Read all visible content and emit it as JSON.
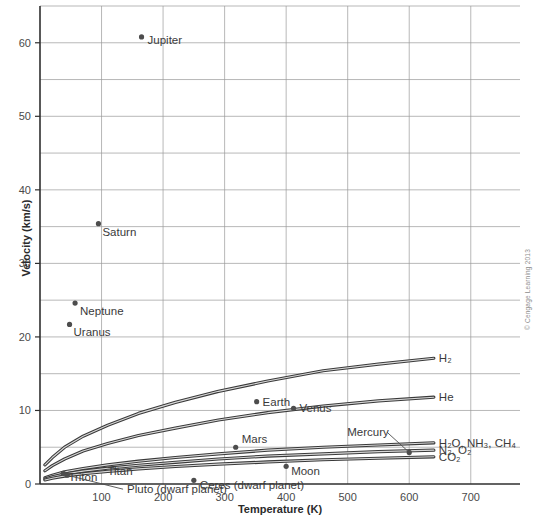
{
  "figure": {
    "credit": "© Cengage Learning 2013"
  },
  "chart_data": {
    "type": "scatter",
    "title": "",
    "xlabel": "Temperature (K)",
    "ylabel": "Velocity (km/s)",
    "xlim": [
      0,
      780
    ],
    "ylim": [
      0,
      65
    ],
    "grid": true,
    "x_ticks": [
      100,
      200,
      300,
      400,
      500,
      600,
      700
    ],
    "x_tick_labels": [
      "100",
      "200",
      "300",
      "400",
      "500",
      "600",
      "700"
    ],
    "x_gridlines": [
      100,
      200,
      300,
      400,
      500,
      600,
      700
    ],
    "y_ticks": [
      0,
      10,
      20,
      30,
      40,
      50,
      60
    ],
    "y_tick_labels": [
      "0",
      "10",
      "20",
      "30",
      "40",
      "50",
      "60"
    ],
    "y_gridlines": [
      5,
      10,
      15,
      20,
      25,
      30,
      35,
      40,
      45,
      50,
      55,
      60,
      65
    ],
    "legend_position": "inline-end-labels",
    "points": [
      {
        "name": "Jupiter",
        "x": 165,
        "y": 60.8,
        "label": "Jupiter",
        "label_dx": 6,
        "label_dy": 7
      },
      {
        "name": "Saturn",
        "x": 95,
        "y": 35.4,
        "label": "Saturn",
        "label_dx": 4,
        "label_dy": 12
      },
      {
        "name": "Neptune",
        "x": 57,
        "y": 24.6,
        "label": "Neptune",
        "label_dx": 5,
        "label_dy": 12
      },
      {
        "name": "Uranus",
        "x": 48,
        "y": 21.7,
        "label": "Uranus",
        "label_dx": 4,
        "label_dy": 12
      },
      {
        "name": "Earth",
        "x": 352,
        "y": 11.2,
        "label": "Earth",
        "label_dx": 6,
        "label_dy": 4
      },
      {
        "name": "Venus",
        "x": 412,
        "y": 10.3,
        "label": "Venus",
        "label_dx": 6,
        "label_dy": 4
      },
      {
        "name": "Mars",
        "x": 318,
        "y": 5.0,
        "label": "Mars",
        "label_dx": 6,
        "label_dy": -4
      },
      {
        "name": "Mercury",
        "x": 600,
        "y": 4.3,
        "label": "Mercury",
        "label_dx": -62,
        "label_dy": -16,
        "leader": true
      },
      {
        "name": "Moon",
        "x": 400,
        "y": 2.4,
        "label": "Moon",
        "label_dx": 5,
        "label_dy": 9
      },
      {
        "name": "Titan",
        "x": 95,
        "y": 2.6,
        "label": "Titan",
        "label_dx": 9,
        "label_dy": 10,
        "hide_dot": true
      },
      {
        "name": "Triton",
        "x": 38,
        "y": 1.45,
        "label": "Triton",
        "label_dx": 5,
        "label_dy": 8
      },
      {
        "name": "Pluto (dwarf planet)",
        "x": 44,
        "y": 1.2,
        "label": "Pluto (dwarf planet)",
        "label_dx": 60,
        "label_dy": 18,
        "leader": true
      },
      {
        "name": "Ceres (dwarf planet)",
        "x": 250,
        "y": 0.5,
        "label": "Ceres (dwarf planet)",
        "label_dx": 6,
        "label_dy": 9
      }
    ],
    "series": [
      {
        "name": "H2",
        "label": "H₂",
        "x": [
          8,
          20,
          40,
          70,
          110,
          160,
          220,
          290,
          370,
          460,
          550,
          640
        ],
        "values": [
          2.6,
          3.6,
          5.0,
          6.5,
          8.0,
          9.6,
          11.1,
          12.6,
          14.0,
          15.4,
          16.3,
          17.1
        ]
      },
      {
        "name": "He",
        "label": "He",
        "x": [
          8,
          20,
          40,
          70,
          110,
          160,
          220,
          290,
          370,
          460,
          550,
          640
        ],
        "values": [
          1.8,
          2.5,
          3.4,
          4.5,
          5.5,
          6.6,
          7.6,
          8.7,
          9.7,
          10.6,
          11.3,
          11.8
        ]
      },
      {
        "name": "H2O, NH3, CH4",
        "label": "H₂O, NH₃, CH₄",
        "x": [
          8,
          20,
          40,
          70,
          110,
          160,
          220,
          290,
          370,
          460,
          550,
          640
        ],
        "values": [
          0.85,
          1.2,
          1.65,
          2.1,
          2.6,
          3.1,
          3.6,
          4.1,
          4.6,
          5.0,
          5.3,
          5.6
        ]
      },
      {
        "name": "N2, O2",
        "label": "N₂, O₂",
        "x": [
          8,
          20,
          40,
          70,
          110,
          160,
          220,
          290,
          370,
          460,
          550,
          640
        ],
        "values": [
          0.68,
          0.98,
          1.35,
          1.75,
          2.15,
          2.55,
          2.95,
          3.4,
          3.8,
          4.1,
          4.4,
          4.6
        ]
      },
      {
        "name": "CO2",
        "label": "CO₂",
        "x": [
          8,
          20,
          40,
          70,
          110,
          160,
          220,
          290,
          370,
          460,
          550,
          640
        ],
        "values": [
          0.55,
          0.78,
          1.08,
          1.4,
          1.72,
          2.05,
          2.38,
          2.7,
          3.0,
          3.3,
          3.5,
          3.7
        ]
      }
    ]
  }
}
